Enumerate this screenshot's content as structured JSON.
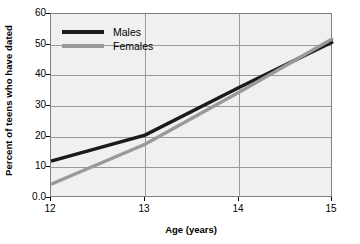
{
  "chart_data": {
    "type": "line",
    "title": "",
    "xlabel": "Age (years)",
    "ylabel": "Percent of teens who have dated",
    "x": [
      12,
      13,
      14,
      15
    ],
    "xticklabels": [
      "12",
      "13",
      "14",
      "15"
    ],
    "yticklabels": [
      "0.0",
      "10",
      "20",
      "30",
      "40",
      "50",
      "60"
    ],
    "yticks": [
      0,
      10,
      20,
      30,
      40,
      50,
      60
    ],
    "xlim": [
      12,
      15
    ],
    "ylim": [
      0,
      60
    ],
    "grid": "both",
    "legend_position": "upper-left-inside",
    "series": [
      {
        "name": "Males",
        "color": "#1a1a1a",
        "values": [
          12,
          20.5,
          36,
          51
        ]
      },
      {
        "name": "Females",
        "color": "#999999",
        "values": [
          4.5,
          17.5,
          34.5,
          52
        ]
      }
    ]
  },
  "colors": {
    "plot_background": "#f0f0f0",
    "page_background": "#ffffff",
    "gridline": "#9a9a9a",
    "frame": "#808080",
    "text": "#000000"
  }
}
